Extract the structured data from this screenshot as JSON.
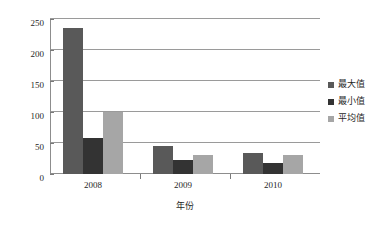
{
  "chart_data": {
    "type": "bar",
    "title": "",
    "subtitle": "",
    "xlabel": "年份",
    "ylabel": "",
    "categories": [
      "2008",
      "2009",
      "2010"
    ],
    "series": [
      {
        "name": "最大值",
        "color": "#595959",
        "values": [
          235,
          45,
          34
        ]
      },
      {
        "name": "最小值",
        "color": "#333333",
        "values": [
          58,
          23,
          17
        ]
      },
      {
        "name": "平均值",
        "color": "#A6A6A6",
        "values": [
          100,
          30,
          30
        ]
      }
    ],
    "ylim": [
      0,
      250
    ],
    "yticks": [
      0,
      50,
      100,
      150,
      200,
      250
    ],
    "ytick_labels": [
      "0",
      "50",
      "100",
      "150",
      "200",
      "250"
    ],
    "grid": true,
    "grid_axis": "y",
    "legend_position": "right",
    "bar_group_mode": "clustered",
    "axis_color": "#8d8d8d",
    "gridline_color": "#9a9a9a",
    "background": "#ffffff"
  }
}
